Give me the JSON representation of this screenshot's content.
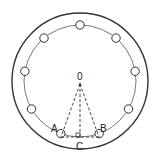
{
  "diagram": {
    "center": {
      "label": "0",
      "x": 80,
      "y": 81
    },
    "outer_circle": {
      "r": 68
    },
    "bolt_circle": {
      "r": 56
    },
    "bolt_hole_r": 4.2,
    "bolt_count": 9,
    "bolt_angles_deg": [
      90,
      130,
      170,
      210,
      250,
      290,
      330,
      10,
      50
    ],
    "points": {
      "A": {
        "label": "A",
        "x": 61,
        "y": 137
      },
      "B": {
        "label": "B",
        "x": 99,
        "y": 137
      },
      "C": {
        "label": "C",
        "x": 80,
        "y": 137
      }
    },
    "labels": {
      "O": "0",
      "A": "A",
      "B": "B",
      "C": "C"
    },
    "colors": {
      "stroke": "#333333",
      "background": "#ffffff"
    }
  }
}
